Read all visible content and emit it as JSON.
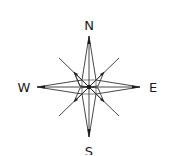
{
  "compass": {
    "labels": {
      "north": "N",
      "south": "S",
      "east": "E",
      "west": "W"
    },
    "colors": {
      "stroke": "#333333",
      "background": "#ffffff"
    }
  }
}
